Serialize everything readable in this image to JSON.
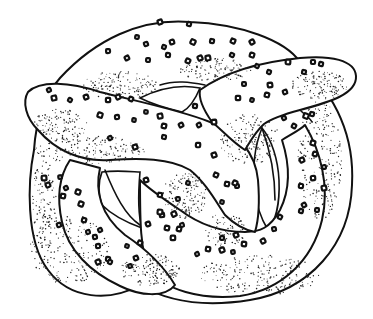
{
  "image": {
    "subject": "pretzel illustration",
    "style": "black-and-white pen drawing with stipple shading and salt crystals",
    "width": 373,
    "height": 319,
    "background": "#ffffff",
    "ink": "#111111"
  },
  "pretzel": {
    "salt_crystals": [
      [
        160,
        22
      ],
      [
        189,
        24
      ],
      [
        137,
        37
      ],
      [
        146,
        44
      ],
      [
        164,
        47
      ],
      [
        172,
        42
      ],
      [
        193,
        42
      ],
      [
        212,
        41
      ],
      [
        233,
        41
      ],
      [
        252,
        42
      ],
      [
        108,
        51
      ],
      [
        127,
        58
      ],
      [
        148,
        60
      ],
      [
        168,
        55
      ],
      [
        188,
        61
      ],
      [
        200,
        58
      ],
      [
        208,
        58
      ],
      [
        232,
        55
      ],
      [
        252,
        55
      ],
      [
        49,
        90
      ],
      [
        54,
        98
      ],
      [
        70,
        100
      ],
      [
        86,
        97
      ],
      [
        108,
        100
      ],
      [
        118,
        97
      ],
      [
        131,
        99
      ],
      [
        100,
        115
      ],
      [
        117,
        117
      ],
      [
        134,
        120
      ],
      [
        146,
        112
      ],
      [
        160,
        116
      ],
      [
        164,
        126
      ],
      [
        181,
        125
      ],
      [
        199,
        125
      ],
      [
        214,
        122
      ],
      [
        195,
        106
      ],
      [
        110,
        138
      ],
      [
        135,
        147
      ],
      [
        164,
        137
      ],
      [
        198,
        145
      ],
      [
        214,
        155
      ],
      [
        244,
        84
      ],
      [
        257,
        66
      ],
      [
        269,
        72
      ],
      [
        270,
        85
      ],
      [
        288,
        62
      ],
      [
        313,
        62
      ],
      [
        321,
        64
      ],
      [
        304,
        72
      ],
      [
        238,
        98
      ],
      [
        252,
        100
      ],
      [
        267,
        95
      ],
      [
        285,
        92
      ],
      [
        284,
        118
      ],
      [
        294,
        126
      ],
      [
        306,
        116
      ],
      [
        312,
        114
      ],
      [
        313,
        143
      ],
      [
        315,
        154
      ],
      [
        302,
        160
      ],
      [
        324,
        167
      ],
      [
        313,
        178
      ],
      [
        301,
        186
      ],
      [
        324,
        188
      ],
      [
        304,
        205
      ],
      [
        317,
        210
      ],
      [
        301,
        211
      ],
      [
        280,
        217
      ],
      [
        274,
        229
      ],
      [
        263,
        241
      ],
      [
        244,
        244
      ],
      [
        236,
        235
      ],
      [
        222,
        238
      ],
      [
        222,
        250
      ],
      [
        233,
        252
      ],
      [
        208,
        249
      ],
      [
        197,
        254
      ],
      [
        162,
        215
      ],
      [
        160,
        212
      ],
      [
        167,
        228
      ],
      [
        173,
        238
      ],
      [
        179,
        229
      ],
      [
        182,
        225
      ],
      [
        174,
        214
      ],
      [
        44,
        178
      ],
      [
        48,
        185
      ],
      [
        60,
        177
      ],
      [
        66,
        188
      ],
      [
        63,
        196
      ],
      [
        78,
        192
      ],
      [
        81,
        204
      ],
      [
        59,
        225
      ],
      [
        84,
        220
      ],
      [
        88,
        232
      ],
      [
        100,
        230
      ],
      [
        95,
        237
      ],
      [
        98,
        246
      ],
      [
        108,
        259
      ],
      [
        98,
        262
      ],
      [
        127,
        246
      ],
      [
        136,
        258
      ],
      [
        130,
        266
      ],
      [
        110,
        262
      ],
      [
        140,
        243
      ],
      [
        148,
        224
      ],
      [
        160,
        195
      ],
      [
        178,
        199
      ],
      [
        146,
        180
      ],
      [
        188,
        183
      ],
      [
        216,
        175
      ],
      [
        227,
        184
      ],
      [
        237,
        186
      ],
      [
        222,
        202
      ],
      [
        235,
        183
      ]
    ],
    "stipple_regions": [
      {
        "cx": 120,
        "cy": 85,
        "rx": 38,
        "ry": 14,
        "count": 140
      },
      {
        "cx": 215,
        "cy": 70,
        "rx": 36,
        "ry": 12,
        "count": 120
      },
      {
        "cx": 90,
        "cy": 150,
        "rx": 55,
        "ry": 14,
        "count": 170
      },
      {
        "cx": 250,
        "cy": 140,
        "rx": 30,
        "ry": 26,
        "count": 150
      },
      {
        "cx": 320,
        "cy": 160,
        "rx": 22,
        "ry": 60,
        "count": 220
      },
      {
        "cx": 70,
        "cy": 250,
        "rx": 40,
        "ry": 35,
        "count": 200
      },
      {
        "cx": 150,
        "cy": 270,
        "rx": 30,
        "ry": 16,
        "count": 150
      },
      {
        "cx": 260,
        "cy": 275,
        "rx": 60,
        "ry": 20,
        "count": 220
      },
      {
        "cx": 185,
        "cy": 195,
        "rx": 22,
        "ry": 24,
        "count": 140
      },
      {
        "cx": 320,
        "cy": 85,
        "rx": 28,
        "ry": 14,
        "count": 130
      },
      {
        "cx": 60,
        "cy": 125,
        "rx": 28,
        "ry": 16,
        "count": 120
      },
      {
        "cx": 44,
        "cy": 200,
        "rx": 12,
        "ry": 40,
        "count": 100
      },
      {
        "cx": 225,
        "cy": 230,
        "rx": 20,
        "ry": 18,
        "count": 90
      }
    ]
  }
}
